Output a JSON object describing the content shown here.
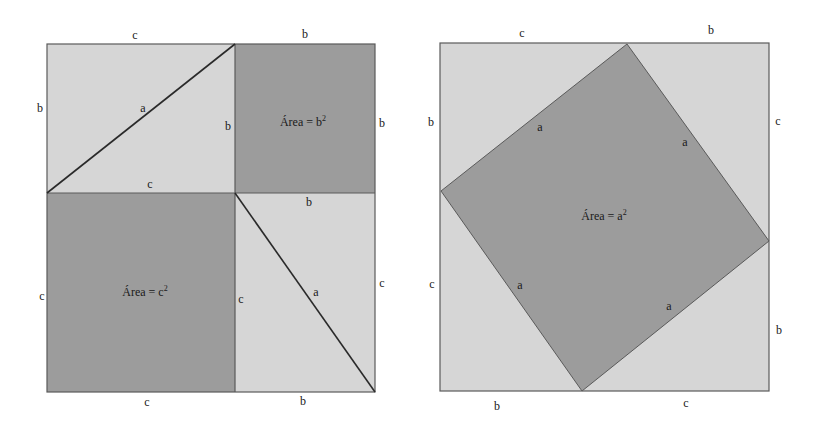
{
  "colors": {
    "light_fill": "#d6d6d6",
    "dark_fill": "#9c9c9c",
    "edge": "#5a5a5a",
    "text": "#1a1a1a"
  },
  "left_figure": {
    "top_labels": [
      "c",
      "b"
    ],
    "left_labels": [
      "b",
      "c"
    ],
    "right_labels": [
      "b",
      "c"
    ],
    "bottom_labels": [
      "c",
      "b"
    ],
    "triangle_top": {
      "hypotenuse": "a",
      "inner_bottom": "c",
      "inner_right": "b"
    },
    "triangle_bottom": {
      "hypotenuse": "a",
      "inner_top": "b",
      "inner_left": "c"
    },
    "square_b": {
      "text": "Área = b",
      "exp": "2"
    },
    "square_c": {
      "text": "Área = c",
      "exp": "2"
    }
  },
  "right_figure": {
    "top_labels": [
      "c",
      "b"
    ],
    "left_labels": [
      "b",
      "c"
    ],
    "right_labels": [
      "c",
      "b"
    ],
    "bottom_labels": [
      "b",
      "c"
    ],
    "side_labels": [
      "a",
      "a",
      "a",
      "a"
    ],
    "square_a": {
      "text": "Área = a",
      "exp": "2"
    }
  }
}
